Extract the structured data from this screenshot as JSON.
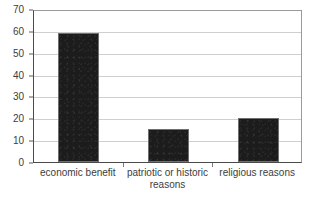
{
  "chart_data": {
    "type": "bar",
    "title": "",
    "subtitle": "",
    "xlabel": "",
    "ylabel": "",
    "categories": [
      "economic benefit",
      "patriotic or historic\nreasons",
      "religious reasons"
    ],
    "values": [
      59,
      15,
      20
    ],
    "ylim": [
      0,
      70
    ],
    "yticks": [
      0,
      10,
      20,
      30,
      40,
      50,
      60,
      70
    ],
    "ytick_labels": [
      "0",
      "10",
      "20",
      "30",
      "40",
      "50",
      "60",
      "70"
    ],
    "grid": true,
    "grid_axis": "y",
    "legend": false,
    "legend_position": "none",
    "series": [
      {
        "name": "",
        "values": [
          59,
          15,
          20
        ]
      }
    ]
  },
  "style": {
    "bar_color": "#1c1c1c",
    "bar_edge_color": "#6f6f6f",
    "gridline_color": "#cfcfcf",
    "axis_color": "#4a4a4a",
    "frame_color": "#9a9a9a",
    "text_color": "#3d3d3d",
    "background_color": "#ffffff"
  }
}
